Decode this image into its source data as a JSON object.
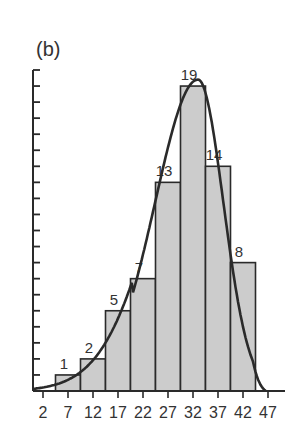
{
  "chart_data": {
    "type": "bar",
    "title": "(b)",
    "xlabel": "",
    "ylabel": "",
    "x_tick_labels": [
      "2",
      "7",
      "12",
      "17",
      "22",
      "27",
      "32",
      "37",
      "42",
      "47"
    ],
    "categories": [
      "7",
      "12",
      "17",
      "22",
      "27",
      "32",
      "37",
      "42"
    ],
    "values": [
      1,
      2,
      5,
      7,
      13,
      19,
      14,
      8
    ],
    "bar_labels": [
      "1",
      "2",
      "5",
      "7",
      "13",
      "19",
      "14",
      "8"
    ],
    "bin_width": 5,
    "ylim": [
      0,
      20
    ],
    "y_ticks_count": 20,
    "y_tick_labels": [],
    "grid": false,
    "legend": null,
    "overlay": "smooth fitted density curve (skewed left) peaking near x=32",
    "colors": {
      "bar_fill": "#cccccc",
      "bar_edge": "#2a2a2a",
      "curve": "#2a2a2a",
      "axis": "#2a2a2a",
      "text": "#333333"
    }
  },
  "panel_label": "(b)"
}
